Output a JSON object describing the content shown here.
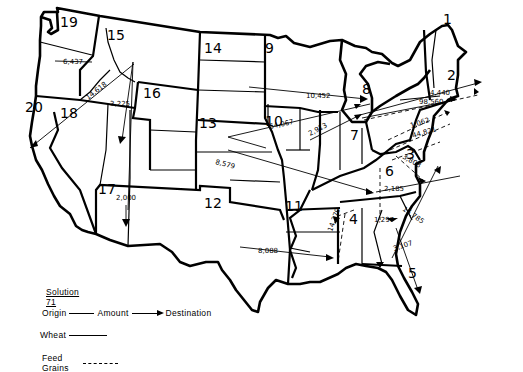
{
  "map": {
    "title": "Solution 71",
    "regions": [
      {
        "id": "1",
        "label": "1",
        "x": 443,
        "y": 24
      },
      {
        "id": "2",
        "label": "2",
        "x": 447,
        "y": 80
      },
      {
        "id": "3",
        "label": "3",
        "x": 406,
        "y": 159
      },
      {
        "id": "4",
        "label": "4",
        "x": 349,
        "y": 224
      },
      {
        "id": "5",
        "label": "5",
        "x": 408,
        "y": 270
      },
      {
        "id": "6",
        "label": "6",
        "x": 385,
        "y": 176
      },
      {
        "id": "7",
        "label": "7",
        "x": 350,
        "y": 137
      },
      {
        "id": "8",
        "label": "8",
        "x": 362,
        "y": 94
      },
      {
        "id": "9",
        "label": "9",
        "x": 265,
        "y": 53
      },
      {
        "id": "10",
        "label": "10",
        "x": 265,
        "y": 126
      },
      {
        "id": "11",
        "label": "11",
        "x": 285,
        "y": 211
      },
      {
        "id": "12",
        "label": "12",
        "x": 204,
        "y": 208
      },
      {
        "id": "13",
        "label": "13",
        "x": 199,
        "y": 124
      },
      {
        "id": "14",
        "label": "14",
        "x": 204,
        "y": 53
      },
      {
        "id": "15",
        "label": "15",
        "x": 107,
        "y": 40
      },
      {
        "id": "16",
        "label": "16",
        "x": 143,
        "y": 98
      },
      {
        "id": "17",
        "label": "17",
        "x": 98,
        "y": 190
      },
      {
        "id": "18",
        "label": "18",
        "x": 60,
        "y": 118
      },
      {
        "id": "19",
        "label": "19",
        "x": 60,
        "y": 27
      },
      {
        "id": "20",
        "label": "20",
        "x": 25,
        "y": 112
      }
    ],
    "flows": [
      {
        "origin": "19",
        "amount": "6,437",
        "destination": "19",
        "commodity": "wheat",
        "label_x": 63,
        "label_y": 62
      },
      {
        "origin": "15",
        "amount": "14,618",
        "destination": "20",
        "commodity": "wheat",
        "label_x": 88,
        "label_y": 112
      },
      {
        "origin": "15",
        "amount": "3,225",
        "destination": "17",
        "commodity": "wheat",
        "label_x": 110,
        "label_y": 106
      },
      {
        "origin": "15",
        "amount": "2,000",
        "destination": "17",
        "commodity": "wheat",
        "label_x": 116,
        "label_y": 198
      },
      {
        "origin": "14",
        "amount": "10,452",
        "destination": "8",
        "commodity": "wheat",
        "label_x": 306,
        "label_y": 96
      },
      {
        "origin": "13",
        "amount": "54,067",
        "destination": "8",
        "commodity": "wheat",
        "label_x": 271,
        "label_y": 126
      },
      {
        "origin": "10",
        "amount": "2,913",
        "destination": "8",
        "commodity": "wheat",
        "label_x": 309,
        "label_y": 131
      },
      {
        "origin": "10",
        "amount": "4,440",
        "destination": "2",
        "commodity": "wheat",
        "label_x": 428,
        "label_y": 93
      },
      {
        "origin": "10",
        "amount": "98,560",
        "destination": "2",
        "commodity": "feed grains",
        "label_x": 420,
        "label_y": 103
      },
      {
        "origin": "7",
        "amount": "1,062",
        "destination": "2",
        "commodity": "feed grains",
        "label_x": 412,
        "label_y": 123
      },
      {
        "origin": "7",
        "amount": "44,821",
        "destination": "2",
        "commodity": "feed grains",
        "label_x": 412,
        "label_y": 134
      },
      {
        "origin": "13",
        "amount": "8,579",
        "destination": "6",
        "commodity": "wheat",
        "label_x": 218,
        "label_y": 166
      },
      {
        "origin": "6",
        "amount": "2,185",
        "destination": "6",
        "commodity": "feed grains",
        "label_x": 384,
        "label_y": 190
      },
      {
        "origin": "7",
        "amount": "3,808",
        "destination": "3",
        "commodity": "feed grains",
        "label_x": 401,
        "label_y": 163
      },
      {
        "origin": "12",
        "amount": "8,088",
        "destination": "4",
        "commodity": "wheat",
        "label_x": 260,
        "label_y": 252
      },
      {
        "origin": "4",
        "amount": "14,379",
        "destination": "11",
        "commodity": "feed grains",
        "label_x": 330,
        "label_y": 228
      },
      {
        "origin": "4",
        "amount": "1,297",
        "destination": "4",
        "commodity": "feed grains",
        "label_x": 376,
        "label_y": 219
      },
      {
        "origin": "5",
        "amount": "15,785",
        "destination": "3",
        "commodity": "wheat",
        "label_x": 404,
        "label_y": 213
      },
      {
        "origin": "5",
        "amount": "3,107",
        "destination": "5",
        "commodity": "wheat",
        "label_x": 398,
        "label_y": 248
      }
    ]
  },
  "legend": {
    "title": "Solution 71",
    "format": {
      "origin": "Origin",
      "amount": "Amount",
      "destination": "Destination"
    },
    "wheat_label": "Wheat",
    "feed_grains_label": "Feed Grains"
  }
}
